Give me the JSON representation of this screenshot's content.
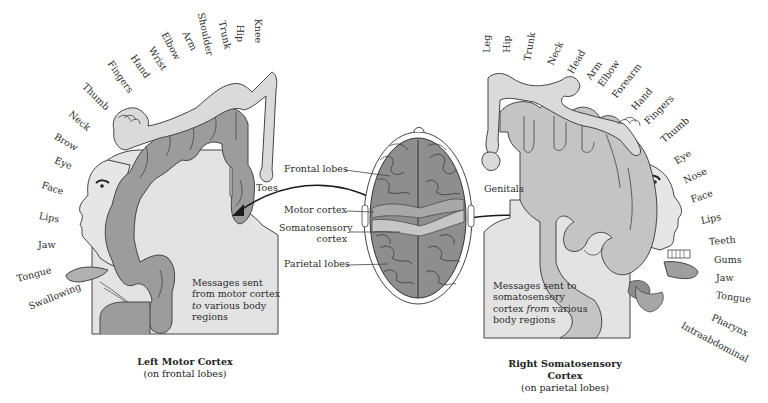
{
  "figure": {
    "left_panel": {
      "caption_title": "Left Motor Cortex",
      "caption_sub": "(on frontal lobes)",
      "message_line1": "Messages sent",
      "message_line2": "from motor cortex",
      "message_italic": "to",
      "message_line3_rest": " various body",
      "message_line4": "regions",
      "body_labels": [
        {
          "text": "Knee",
          "x": 263,
          "y": 14,
          "rot": 90
        },
        {
          "text": "Hip",
          "x": 245,
          "y": 20,
          "rot": 90
        },
        {
          "text": "Trunk",
          "x": 226,
          "y": 18,
          "rot": 80
        },
        {
          "text": "Shoulder",
          "x": 205,
          "y": 10,
          "rot": 80
        },
        {
          "text": "Arm",
          "x": 186,
          "y": 27,
          "rot": 62
        },
        {
          "text": "Elbow",
          "x": 166,
          "y": 30,
          "rot": 62
        },
        {
          "text": "Wrist",
          "x": 153,
          "y": 45,
          "rot": 58
        },
        {
          "text": "Hand",
          "x": 136,
          "y": 53,
          "rot": 55
        },
        {
          "text": "Fingers",
          "x": 113,
          "y": 59,
          "rot": 55
        },
        {
          "text": "Thumb",
          "x": 88,
          "y": 80,
          "rot": 45
        },
        {
          "text": "Neck",
          "x": 72,
          "y": 108,
          "rot": 40
        },
        {
          "text": "Brow",
          "x": 56,
          "y": 130,
          "rot": 30
        },
        {
          "text": "Eye",
          "x": 54,
          "y": 154,
          "rot": 22
        },
        {
          "text": "Face",
          "x": 42,
          "y": 182,
          "rot": 18
        },
        {
          "text": "Lips",
          "x": 40,
          "y": 210,
          "rot": 10
        },
        {
          "text": "Jaw",
          "x": 38,
          "y": 240,
          "rot": 0
        },
        {
          "text": "Tongue",
          "x": 18,
          "y": 272,
          "rot": -15
        },
        {
          "text": "Swallowing",
          "x": 30,
          "y": 305,
          "rot": -22
        },
        {
          "text": "Toes",
          "x": 256,
          "y": 186,
          "rot": 0
        }
      ]
    },
    "center": {
      "callouts": {
        "frontal_lobes": "Frontal lobes",
        "motor_cortex": "Motor cortex",
        "somatosensory_line1": "Somatosensory",
        "somatosensory_line2": "cortex",
        "parietal_lobes": "Parietal lobes"
      }
    },
    "right_panel": {
      "caption_title": "Right Somatosensory Cortex",
      "caption_sub": "(on parietal lobes)",
      "message_line1": "Messages sent to",
      "message_line2": "somatosensory",
      "message_line3_pre": "cortex ",
      "message_italic": "from",
      "message_line3_post": " various",
      "message_line4": "body regions",
      "body_labels": [
        {
          "text": "Leg",
          "x": 490,
          "y": 40,
          "rot": -90
        },
        {
          "text": "Hip",
          "x": 510,
          "y": 40,
          "rot": -90
        },
        {
          "text": "Trunk",
          "x": 530,
          "y": 48,
          "rot": -80
        },
        {
          "text": "Neck",
          "x": 553,
          "y": 58,
          "rot": -65
        },
        {
          "text": "Head",
          "x": 572,
          "y": 66,
          "rot": -60
        },
        {
          "text": "Arm",
          "x": 589,
          "y": 72,
          "rot": -55
        },
        {
          "text": "Elbow",
          "x": 601,
          "y": 80,
          "rot": -55
        },
        {
          "text": "Forearm",
          "x": 616,
          "y": 91,
          "rot": -52
        },
        {
          "text": "Hand",
          "x": 635,
          "y": 104,
          "rot": -48
        },
        {
          "text": "Fingers",
          "x": 648,
          "y": 118,
          "rot": -45
        },
        {
          "text": "Thumb",
          "x": 664,
          "y": 137,
          "rot": -40
        },
        {
          "text": "Eye",
          "x": 677,
          "y": 158,
          "rot": -32
        },
        {
          "text": "Nose",
          "x": 686,
          "y": 177,
          "rot": -25
        },
        {
          "text": "Face",
          "x": 692,
          "y": 196,
          "rot": -18
        },
        {
          "text": "Lips",
          "x": 701,
          "y": 216,
          "rot": -12
        },
        {
          "text": "Teeth",
          "x": 708,
          "y": 238,
          "rot": -5
        },
        {
          "text": "Gums",
          "x": 714,
          "y": 256,
          "rot": 0
        },
        {
          "text": "Jaw",
          "x": 716,
          "y": 274,
          "rot": 0
        },
        {
          "text": "Tongue",
          "x": 716,
          "y": 292,
          "rot": 8
        },
        {
          "text": "Pharynx",
          "x": 712,
          "y": 312,
          "rot": 25
        },
        {
          "text": "Intraabdominal",
          "x": 680,
          "y": 318,
          "rot": 28
        },
        {
          "text": "Genitals",
          "x": 484,
          "y": 189,
          "rot": 0
        }
      ]
    },
    "colors": {
      "cortex_dark": "#9a9a9a",
      "cortex_light": "#c6c6c6",
      "homunculus": "#d9d9d9",
      "body_panel": "#e2e2e2",
      "brain": "#8e8e8e",
      "brain_highlight": "#c4c4c4",
      "outline": "#333333"
    }
  }
}
